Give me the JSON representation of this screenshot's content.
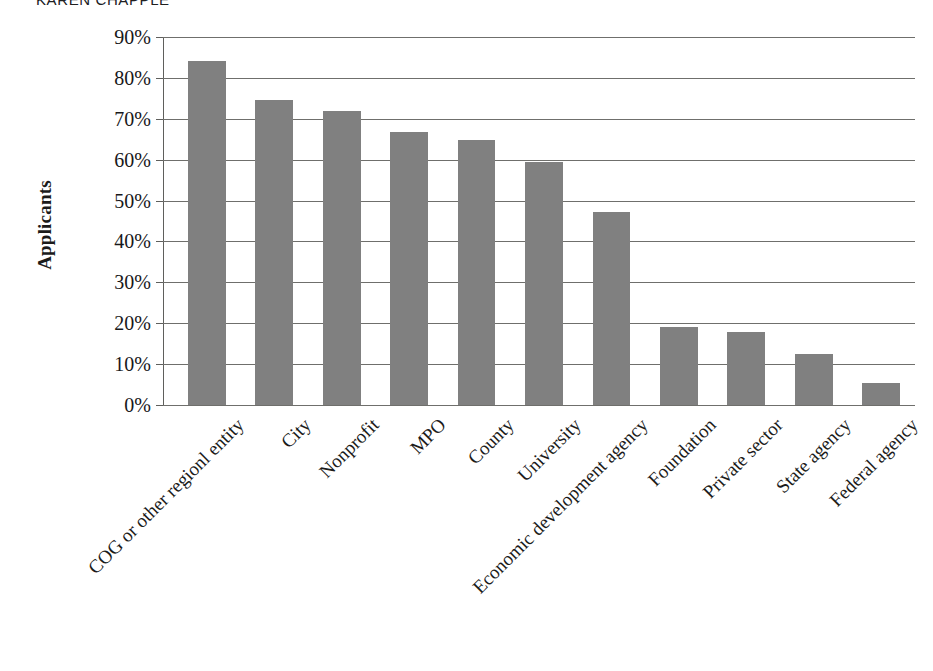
{
  "header": {
    "running_head": "KAREN CHAPPLE"
  },
  "chart_data": {
    "type": "bar",
    "title": "",
    "xlabel": "",
    "ylabel": "Applicants",
    "ylim": [
      0,
      90
    ],
    "ytick_labels": [
      "90%",
      "80%",
      "70%",
      "60%",
      "50%",
      "40%",
      "30%",
      "20%",
      "10%",
      "0%"
    ],
    "ytick_values": [
      90,
      80,
      70,
      60,
      50,
      40,
      30,
      20,
      10,
      0
    ],
    "grid": "horizontal",
    "legend": "none",
    "bar_color": "#808080",
    "categories": [
      "COG or other regionl entity",
      "City",
      "Nonprofit",
      "MPO",
      "County",
      "University",
      "Economic development agency",
      "Foundation",
      "Private sector",
      "State agency",
      "Federal agency"
    ],
    "values": [
      84.2,
      74.7,
      72.0,
      66.8,
      64.8,
      59.4,
      47.1,
      19.1,
      17.9,
      12.4,
      5.5
    ],
    "value_labels": [
      "84%",
      "75%",
      "72%",
      "67%",
      "65%",
      "59%",
      "47%",
      "19%",
      "18%",
      "12%",
      "6%"
    ]
  }
}
